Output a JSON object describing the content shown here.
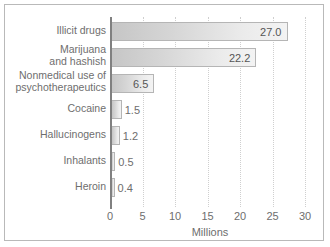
{
  "chart_data": {
    "type": "bar",
    "orientation": "horizontal",
    "title": "",
    "xlabel": "Millions",
    "ylabel": "",
    "xlim": [
      0,
      30
    ],
    "xticks": [
      "0",
      "5",
      "10",
      "15",
      "20",
      "25",
      "30"
    ],
    "xtick_values": [
      0,
      5,
      10,
      15,
      20,
      25,
      30
    ],
    "grid": "vertical-dotted",
    "legend": "none",
    "categories": [
      "Illicit drugs",
      "Marijuana\nand hashish",
      "Nonmedical use of\npsychotherapeutics",
      "Cocaine",
      "Hallucinogens",
      "Inhalants",
      "Heroin"
    ],
    "values": [
      27.0,
      22.2,
      6.5,
      1.5,
      1.2,
      0.5,
      0.4
    ],
    "value_labels": [
      "27.0",
      "22.2",
      "6.5",
      "1.5",
      "1.2",
      "0.5",
      "0.4"
    ],
    "label_placement": [
      "inside",
      "inside",
      "inside",
      "outside",
      "outside",
      "outside",
      "outside"
    ],
    "colors": {
      "bar_gradient_start": "#c6c6c6",
      "bar_gradient_end": "#f3f3f3",
      "bar_border": "#b5b5b5",
      "axis": "#808080",
      "gridline": "#cfcfcf",
      "text": "#6e6e6e",
      "frame": "#b9b9b9",
      "background": "#ffffff"
    }
  }
}
